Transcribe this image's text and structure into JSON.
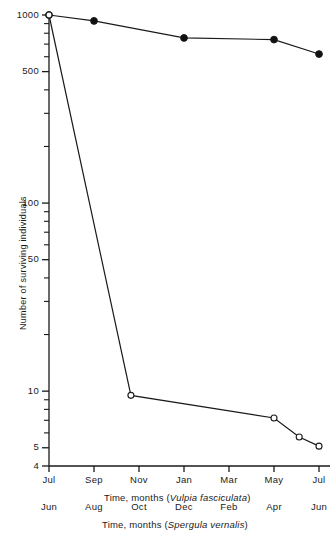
{
  "chart_data": {
    "type": "line",
    "title": "",
    "xlabel": "Time, months (Vulpia fasciculata)",
    "xlabel_secondary": "Time, months (Spergula vernalis)",
    "ylabel": "Number of surviving individuals",
    "yscale": "log",
    "ylim": [
      4,
      1000
    ],
    "ytick_labels": [
      "1000",
      "500",
      "100",
      "50",
      "10",
      "5",
      "4"
    ],
    "ytick_values": [
      1000,
      500,
      100,
      50,
      10,
      5,
      4
    ],
    "yminor_values": [
      900,
      800,
      700,
      600,
      400,
      300,
      200,
      90,
      80,
      70,
      60,
      40,
      30,
      20,
      9,
      8,
      7,
      6
    ],
    "grid": false,
    "legend": "none",
    "x_primary_labels": [
      "Jul",
      "Sep",
      "Nov",
      "Jan",
      "Mar",
      "May",
      "Jul"
    ],
    "x_secondary_labels": [
      "Jun",
      "Aug",
      "Oct",
      "Dec",
      "Feb",
      "Apr",
      "Jun"
    ],
    "series": [
      {
        "name": "Vulpia fasciculata",
        "marker": "filled-circle",
        "x": [
          0,
          1,
          3,
          5,
          6
        ],
        "x_labels": [
          "Jul",
          "Sep",
          "Jan",
          "May",
          "Jul"
        ],
        "values": [
          1000,
          930,
          755,
          740,
          620
        ]
      },
      {
        "name": "Spergula vernalis",
        "marker": "open-circle",
        "x": [
          0,
          1.82,
          5.0,
          5.56,
          6
        ],
        "x_labels": [
          "Jun",
          "Oct",
          "Apr",
          "May",
          "Jun"
        ],
        "values": [
          1000,
          9.5,
          7.2,
          5.7,
          5.1
        ]
      }
    ]
  },
  "axis_captions": {
    "primary_prefix": "Time, months (",
    "primary_species": "Vulpia fasciculata",
    "primary_suffix": ")",
    "secondary_prefix": "Time, months (",
    "secondary_species": "Spergula vernalis",
    "secondary_suffix": ")"
  },
  "ylabel": {
    "text": "Number of surviving individuals"
  },
  "colors": {
    "axis": "#1a1a1a",
    "line": "#1a1a1a",
    "marker_fill": "#111111",
    "marker_open_fill": "#ffffff",
    "background": "#ffffff"
  }
}
